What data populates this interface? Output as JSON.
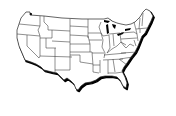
{
  "map": {
    "subject": "Contiguous United States outline map with state borders",
    "style": "black outline, white fill, drop shadow on southern and eastern coasts",
    "colors": {
      "background": "#ffffff",
      "land_fill": "#ffffff",
      "border": "#333333",
      "shadow": "#000000"
    },
    "labels": []
  }
}
